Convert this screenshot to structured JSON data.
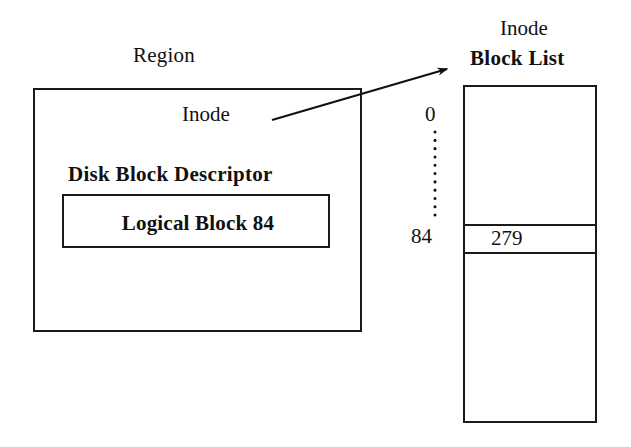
{
  "diagram": {
    "stroke_color": "#1a1a1a",
    "background_color": "#ffffff"
  },
  "region": {
    "title": "Region",
    "inode_label": "Inode",
    "disk_block_descriptor": {
      "title": "Disk Block Descriptor",
      "entry": "Logical Block 84"
    }
  },
  "inode_block_list": {
    "title_line1": "Inode",
    "title_line2": "Block List",
    "index_start": "0",
    "index_highlight": "84",
    "entry_value": "279"
  },
  "connector": {
    "name": "inode-pointer-arrow",
    "from": "Inode",
    "to": "Inode Block List"
  }
}
